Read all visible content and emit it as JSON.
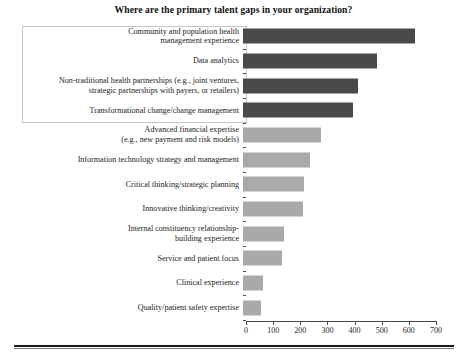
{
  "chart_data": {
    "type": "bar",
    "orientation": "horizontal",
    "title": "Where are the primary talent gaps in your organization?",
    "xlabel": "",
    "ylabel": "",
    "xlim": [
      0,
      700
    ],
    "xticks": [
      0,
      100,
      200,
      300,
      400,
      500,
      600,
      700
    ],
    "grid": false,
    "legend": null,
    "categories": [
      "Community and population health management experience",
      "Data analytics",
      "Non-traditional health partnerships (e.g., joint ventures, strategic partnerships with payers, or retailers)",
      "Transformational change/change management",
      "Advanced financial expertise (e.g., new payment and risk models)",
      "Information technology strategy and management",
      "Critical thinking/strategic planning",
      "Innovative thinking/creativity",
      "Internal constituency relationship-building experience",
      "Service and patient focus",
      "Clinical experience",
      "Quality/patient safety expertise"
    ],
    "values": [
      632,
      492,
      424,
      404,
      286,
      248,
      226,
      222,
      152,
      145,
      75,
      67
    ],
    "bar_colors": [
      "#4a4a4a",
      "#4a4a4a",
      "#4a4a4a",
      "#4a4a4a",
      "#a9a9a9",
      "#a9a9a9",
      "#a9a9a9",
      "#a9a9a9",
      "#a9a9a9",
      "#a9a9a9",
      "#a9a9a9",
      "#a9a9a9"
    ],
    "highlighted_categories": [
      0,
      1,
      2,
      3
    ],
    "colors": {
      "dark_bar": "#4a4a4a",
      "light_bar": "#a9a9a9",
      "axis": "#4a4a4a",
      "highlight_border": "#c6c6c6",
      "text": "#1c1c1c"
    }
  },
  "labels": {
    "lines": [
      [
        "Community and population health",
        "management experience"
      ],
      [
        "Data analytics"
      ],
      [
        "Non-traditional health partnerships (e.g., joint ventures,",
        "strategic partnerships with payers, or retailers)"
      ],
      [
        "Transformational change/change management"
      ],
      [
        "Advanced financial expertise",
        "(e.g., new payment and risk models)"
      ],
      [
        "Information technology strategy and management"
      ],
      [
        "Critical thinking/strategic planning"
      ],
      [
        "Innovative thinking/creativity"
      ],
      [
        "Internal constituency relationship-",
        "building experience"
      ],
      [
        "Service and patient focus"
      ],
      [
        "Clinical experience"
      ],
      [
        "Quality/patient safety expertise"
      ]
    ]
  },
  "axis": {
    "tick_labels": [
      "0",
      "100",
      "200",
      "300",
      "400",
      "500",
      "600",
      "700"
    ]
  }
}
